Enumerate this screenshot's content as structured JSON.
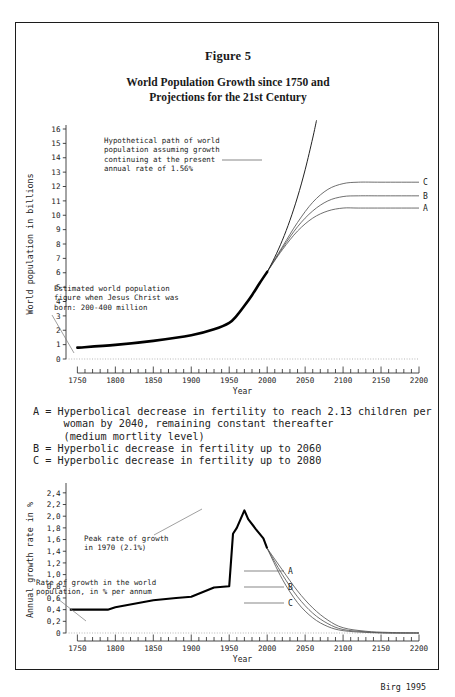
{
  "figure": {
    "number": "Figure 5",
    "title_line1": "World Population Growth since 1750 and",
    "title_line2": "Projections for the 21st Century",
    "source": "Birg 1995"
  },
  "legend": {
    "a_line1": "A = Hyperbolical decrease in fertility to reach 2.13 children per",
    "a_line2": "woman by 2040, remaining constant thereafter",
    "a_line3": "(medium mortlity level)",
    "b_line": "B = Hyperbolic decrease in fertility up to 2060",
    "c_line": "C = Hyperbolic decrease in fertility up to 2080"
  },
  "chart_data": [
    {
      "id": "population",
      "type": "line",
      "title": "",
      "xlabel": "Year",
      "ylabel": "World population in billions",
      "xlim": [
        1735,
        2200
      ],
      "ylim": [
        0,
        16
      ],
      "xticks": [
        1750,
        1800,
        1850,
        1900,
        1950,
        2000,
        2050,
        2100,
        2150,
        2200
      ],
      "xticklabels": [
        "1750",
        "1800",
        "1850",
        "1900",
        "1950",
        "2000",
        "2050",
        "2100",
        "2150",
        "2200"
      ],
      "yticks": [
        0,
        1,
        2,
        3,
        4,
        5,
        6,
        7,
        8,
        9,
        10,
        11,
        12,
        13,
        14,
        15,
        16
      ],
      "yticklabels": [
        "0",
        "1",
        "2",
        "3",
        "4",
        "5",
        "6",
        "7",
        "8",
        "9",
        "10",
        "11",
        "12",
        "13",
        "14",
        "15",
        "16"
      ],
      "minor_tick_step": 10,
      "grid": false,
      "legend_position": "right-inline",
      "series": [
        {
          "name": "historical",
          "style": "thick-black",
          "x": [
            1750,
            1800,
            1850,
            1900,
            1930,
            1950,
            1960,
            1970,
            1980,
            1990,
            2000
          ],
          "values": [
            0.79,
            0.98,
            1.26,
            1.65,
            2.07,
            2.52,
            3.02,
            3.7,
            4.44,
            5.27,
            6.06
          ]
        },
        {
          "name": "A",
          "label": "A",
          "style": "thin-grey",
          "x": [
            2000,
            2020,
            2040,
            2060,
            2080,
            2100,
            2120,
            2150,
            2200
          ],
          "values": [
            6.06,
            7.6,
            8.9,
            9.8,
            10.3,
            10.5,
            10.5,
            10.5,
            10.5
          ]
        },
        {
          "name": "B",
          "label": "B",
          "style": "thin-grey",
          "x": [
            2000,
            2020,
            2040,
            2060,
            2080,
            2100,
            2120,
            2150,
            2200
          ],
          "values": [
            6.06,
            7.7,
            9.2,
            10.3,
            11.0,
            11.3,
            11.35,
            11.35,
            11.35
          ]
        },
        {
          "name": "C",
          "label": "C",
          "style": "thin-grey",
          "x": [
            2000,
            2020,
            2040,
            2060,
            2080,
            2100,
            2120,
            2150,
            2200
          ],
          "values": [
            6.06,
            7.8,
            9.5,
            10.9,
            11.8,
            12.2,
            12.3,
            12.3,
            12.3
          ]
        },
        {
          "name": "hypothetical-1.56pct",
          "label": "Hypothetical path",
          "style": "thin-black",
          "x": [
            1990,
            2000,
            2010,
            2020,
            2030,
            2040,
            2050,
            2060,
            2065
          ],
          "values": [
            5.27,
            6.06,
            7.08,
            8.26,
            9.65,
            11.27,
            13.16,
            15.37,
            16.6
          ]
        }
      ],
      "annotations": [
        {
          "id": "hypothetical-note",
          "lines": [
            "Hypothetical path of world",
            "population assuming growth",
            "continuing at the present",
            "annual rate of 1.56%"
          ]
        },
        {
          "id": "jesus-christ-note",
          "lines": [
            "Estimated world population",
            "figure when Jesus Christ was",
            "born: 200-400 million"
          ]
        }
      ]
    },
    {
      "id": "growth-rate",
      "type": "line",
      "title": "",
      "xlabel": "Year",
      "ylabel": "Annual growth rate in %",
      "xlim": [
        1735,
        2200
      ],
      "ylim": [
        0,
        2.5
      ],
      "xticks": [
        1750,
        1800,
        1850,
        1900,
        1950,
        2000,
        2050,
        2100,
        2150,
        2200
      ],
      "xticklabels": [
        "1750",
        "1800",
        "1850",
        "1900",
        "1950",
        "2000",
        "2050",
        "2100",
        "2150",
        "2200"
      ],
      "yticks": [
        0,
        0.2,
        0.4,
        0.6,
        0.8,
        1.0,
        1.2,
        1.4,
        1.6,
        1.8,
        2.0,
        2.2,
        2.4
      ],
      "yticklabels": [
        "0",
        "0,2",
        "0,4",
        "0,6",
        "0,8",
        "1,0",
        "1,2",
        "1,4",
        "1,6",
        "1,8",
        "2,0",
        "2,2",
        "2,4"
      ],
      "minor_tick_step": 10,
      "grid": false,
      "legend_position": "right-inline",
      "series": [
        {
          "name": "historical",
          "style": "thick-black",
          "x": [
            1740,
            1790,
            1800,
            1850,
            1880,
            1900,
            1930,
            1950,
            1955,
            1960,
            1965,
            1970,
            1975,
            1985,
            1995,
            2000
          ],
          "values": [
            0.4,
            0.4,
            0.44,
            0.56,
            0.6,
            0.62,
            0.78,
            0.8,
            1.7,
            1.8,
            1.95,
            2.1,
            1.95,
            1.78,
            1.62,
            1.45
          ]
        },
        {
          "name": "A",
          "label": "A",
          "style": "thin-grey",
          "x": [
            2000,
            2020,
            2040,
            2060,
            2080,
            2100,
            2130,
            2160,
            2200
          ],
          "values": [
            1.45,
            0.92,
            0.52,
            0.26,
            0.11,
            0.04,
            0.01,
            0.0,
            0.0
          ]
        },
        {
          "name": "B",
          "label": "B",
          "style": "thin-grey",
          "x": [
            2000,
            2020,
            2040,
            2060,
            2080,
            2100,
            2130,
            2160,
            2200
          ],
          "values": [
            1.45,
            1.0,
            0.62,
            0.34,
            0.16,
            0.06,
            0.02,
            0.0,
            0.0
          ]
        },
        {
          "name": "C",
          "label": "C",
          "style": "thin-grey",
          "x": [
            2000,
            2020,
            2040,
            2060,
            2080,
            2100,
            2130,
            2160,
            2200
          ],
          "values": [
            1.45,
            1.08,
            0.72,
            0.43,
            0.22,
            0.09,
            0.03,
            0.01,
            0.0
          ]
        }
      ],
      "annotations": [
        {
          "id": "peak-note",
          "lines": [
            "Peak rate of growth",
            "in 1970 (2.1%)"
          ]
        },
        {
          "id": "rate-note",
          "lines": [
            "Rate of growth in the world",
            "population, in % per annum"
          ]
        }
      ]
    }
  ]
}
